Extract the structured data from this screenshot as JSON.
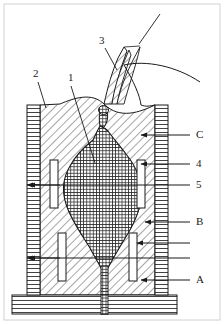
{
  "figure": {
    "type": "cross-section-technical-diagram",
    "background_color": "#ffffff",
    "line_color": "#1a1a1a",
    "hatch_color": "#333333",
    "frame": {
      "visible": true,
      "color": "#cfcfcf"
    }
  },
  "callouts": {
    "left_top": [
      {
        "id": "label-2",
        "text": "2",
        "x": 33,
        "y": 74,
        "leader_from": [
          38,
          82
        ],
        "leader_to": [
          46,
          108
        ],
        "points_to": "left-wall-top"
      },
      {
        "id": "label-1",
        "text": "1",
        "x": 68,
        "y": 78,
        "leader_from": [
          71,
          86
        ],
        "leader_to": [
          95,
          163
        ],
        "points_to": "central-pool"
      },
      {
        "id": "label-3",
        "text": "3",
        "x": 99,
        "y": 41,
        "leader_from": [
          105,
          48
        ],
        "leader_to": [
          117,
          70
        ],
        "points_to": "arc-spike"
      }
    ],
    "right_side": [
      {
        "id": "label-C",
        "text": "C",
        "x": 196,
        "y": 130,
        "tick_y": 135,
        "tick_x1": 168,
        "tick_x2": 190,
        "arrow_to_x": 141,
        "arrow": true
      },
      {
        "id": "label-4",
        "text": "4",
        "x": 196,
        "y": 159,
        "tick_y": 164,
        "tick_x1": 168,
        "tick_x2": 190,
        "arrow_to_x": 141,
        "arrow": true
      },
      {
        "id": "label-5",
        "text": "5",
        "x": 196,
        "y": 180,
        "tick_y": 185,
        "tick_x1": 168,
        "tick_x2": 190,
        "arrow_to_x": 27,
        "arrow": true
      },
      {
        "id": "label-B",
        "text": "B",
        "x": 196,
        "y": 217,
        "tick_y": 222,
        "tick_x1": 168,
        "tick_x2": 190,
        "arrow_to_x": 145,
        "arrow": true
      },
      {
        "id": "label-blank-1",
        "text": "",
        "x": 196,
        "y": 239,
        "tick_y": 243,
        "tick_x1": 168,
        "tick_x2": 190,
        "arrow_to_x": 137,
        "arrow": true
      },
      {
        "id": "label-blank-2",
        "text": "",
        "x": 196,
        "y": 254,
        "tick_y": 258,
        "tick_x1": 168,
        "tick_x2": 190,
        "arrow_to_x": 27,
        "arrow": true
      },
      {
        "id": "label-A",
        "text": "A",
        "x": 196,
        "y": 275,
        "tick_y": 280,
        "tick_x1": 168,
        "tick_x2": 190,
        "arrow_to_x": 141,
        "arrow": true
      }
    ]
  },
  "regions": {
    "left_wall": {
      "x": 27,
      "y": 105,
      "w": 13,
      "h": 190,
      "hatch": "horizontal"
    },
    "right_wall": {
      "x": 155,
      "y": 105,
      "w": 13,
      "h": 190,
      "hatch": "horizontal"
    },
    "base_slab": {
      "x": 12,
      "y": 295,
      "w": 165,
      "h": 19,
      "hatch": "horizontal"
    },
    "body": {
      "hatch": "diagonal-45",
      "note": "refractory body between walls"
    },
    "pool": {
      "hatch": "cross-grid",
      "note": "central molten pool / ingot"
    },
    "spout": {
      "x": 101,
      "y": 268,
      "w": 7,
      "h": 46,
      "hatch": "cross-grid"
    },
    "coils": [
      {
        "id": "coil-left-upper",
        "x": 50,
        "y": 160,
        "w": 8,
        "h": 48
      },
      {
        "id": "coil-left-lower",
        "x": 58,
        "y": 233,
        "w": 8,
        "h": 48
      },
      {
        "id": "coil-right-upper",
        "x": 137,
        "y": 160,
        "w": 8,
        "h": 48
      },
      {
        "id": "coil-right-lower",
        "x": 129,
        "y": 233,
        "w": 8,
        "h": 48
      }
    ],
    "arc_spike": {
      "note": "hatched electrode / arc jet entering from top"
    },
    "dome_curve": {
      "note": "curved free-surface line sweeping to upper right"
    }
  }
}
